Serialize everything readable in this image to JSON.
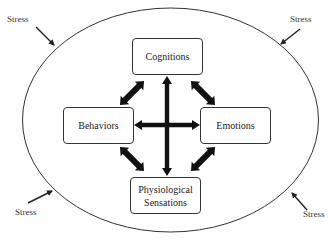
{
  "diagram": {
    "boundary": {
      "shape": "ellipse",
      "stroke": "#333333"
    },
    "nodes": [
      {
        "id": "cognitions",
        "label": "Cognitions"
      },
      {
        "id": "behaviors",
        "label": "Behaviors"
      },
      {
        "id": "emotions",
        "label": "Emotions"
      },
      {
        "id": "physiological",
        "label_line1": "Physiological",
        "label_line2": "Sensations"
      }
    ],
    "edges": [
      {
        "from": "cognitions",
        "to": "behaviors",
        "type": "bidirectional"
      },
      {
        "from": "cognitions",
        "to": "emotions",
        "type": "bidirectional"
      },
      {
        "from": "behaviors",
        "to": "physiological",
        "type": "bidirectional"
      },
      {
        "from": "emotions",
        "to": "physiological",
        "type": "bidirectional"
      },
      {
        "from": "cognitions",
        "to": "physiological",
        "type": "bidirectional"
      },
      {
        "from": "behaviors",
        "to": "emotions",
        "type": "bidirectional"
      }
    ],
    "external_inputs": [
      {
        "position": "top-left",
        "label": "Stress"
      },
      {
        "position": "top-right",
        "label": "Stress"
      },
      {
        "position": "bottom-left",
        "label": "Stress"
      },
      {
        "position": "bottom-right",
        "label": "Stress"
      }
    ],
    "arrow_color": "#111111"
  }
}
